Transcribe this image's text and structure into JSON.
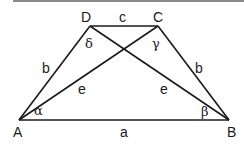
{
  "diagram": {
    "type": "isosceles trapezoid",
    "vertices": {
      "A": {
        "label": "A",
        "x": 19,
        "y": 120
      },
      "B": {
        "label": "B",
        "x": 229,
        "y": 120
      },
      "C": {
        "label": "C",
        "x": 158,
        "y": 26
      },
      "D": {
        "label": "D",
        "x": 90,
        "y": 26
      }
    },
    "sides": {
      "a": "a",
      "b_left": "b",
      "b_right": "b",
      "c": "c"
    },
    "diagonals": {
      "e_left": "e",
      "e_right": "e"
    },
    "angles": {
      "alpha": "α",
      "beta": "β",
      "gamma": "γ",
      "delta": "δ"
    },
    "colors": {
      "stroke": "#1a1a1a",
      "top_bar": "#8a8a8a",
      "background": "#ffffff"
    }
  }
}
